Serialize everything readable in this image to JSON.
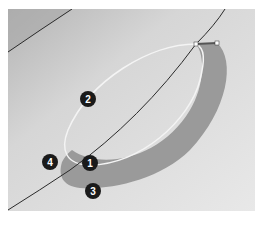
{
  "figure": {
    "colors": {
      "background_light": "#e4e4e4",
      "background_dark": "#b8b8b8",
      "band_fill": "#9a9a9a",
      "outline_curve": "#f4f4f4",
      "edge_curve": "#2a2a2a",
      "callout_fill": "#1a1a1a",
      "callout_text": "#ffffff",
      "handle_fill": "#ffffff"
    },
    "callouts": [
      {
        "label": "1",
        "x": 90,
        "y": 163
      },
      {
        "label": "2",
        "x": 88,
        "y": 99
      },
      {
        "label": "3",
        "x": 93,
        "y": 191
      },
      {
        "label": "4",
        "x": 50,
        "y": 162
      }
    ]
  },
  "caption": {
    "text": ""
  }
}
